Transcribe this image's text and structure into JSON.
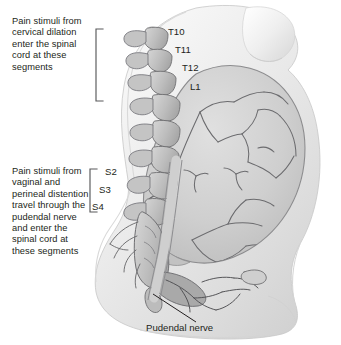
{
  "figure": {
    "background_color": "#ffffff",
    "text_color": "#231f20",
    "line_color": "#58595b",
    "body_fill": "#f0f0f0",
    "organ_fill": "#d5d5d5",
    "bone_fill": "#c9c9c9",
    "outline_color": "#6f6f72"
  },
  "callouts": {
    "cervical": "Pain stimuli from cervical dilation enter the spinal cord at these segments",
    "pudendal": "Pain stimuli from vaginal and perineal distention travel through the pudendal nerve and enter the spinal cord at these segments"
  },
  "segment_labels": {
    "thoracic": [
      {
        "id": "t10",
        "text": "T10"
      },
      {
        "id": "t11",
        "text": "T11"
      },
      {
        "id": "t12",
        "text": "T12"
      },
      {
        "id": "l1",
        "text": "L1"
      }
    ],
    "sacral": [
      {
        "id": "s2",
        "text": "S2"
      },
      {
        "id": "s3",
        "text": "S3"
      },
      {
        "id": "s4",
        "text": "S4"
      }
    ]
  },
  "annotations": {
    "pudendal_nerve": "Pudendal nerve"
  },
  "brackets": {
    "upper": {
      "name": "cervical-segment-bracket"
    },
    "lower": {
      "name": "sacral-segment-bracket"
    }
  }
}
